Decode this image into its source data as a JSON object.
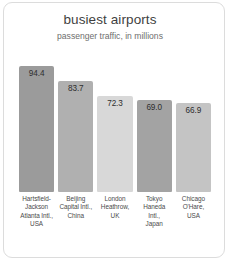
{
  "card": {
    "background": "#ffffff",
    "border_color": "#dcdcdc"
  },
  "chart_data": {
    "type": "bar",
    "title": "busiest airports",
    "subtitle": "passenger traffic, in millions",
    "xlabel": "",
    "ylabel": "",
    "ylim": [
      0,
      100
    ],
    "grid": false,
    "legend": "none",
    "value_label_position": "inside-top",
    "categories": [
      "Hartsfield-Jackson Atlanta Intl., USA",
      "Beijing Capital Intl., China",
      "London Heathrow, UK",
      "Tokyo Haneda Intl., Japan",
      "Chicago O'Hare, USA"
    ],
    "category_lines": [
      [
        "Hartsfield-",
        "Jackson",
        "Atlanta Intl.,",
        "USA"
      ],
      [
        "Beijing",
        "Capital Intl.,",
        "China"
      ],
      [
        "London",
        "Heathrow,",
        "UK"
      ],
      [
        "Tokyo",
        "Haneda",
        "Intl.,",
        "Japan"
      ],
      [
        "Chicago",
        "O'Hare,",
        "USA"
      ]
    ],
    "values": [
      94.4,
      83.7,
      72.3,
      69.0,
      66.9
    ],
    "value_labels": [
      "94.4",
      "83.7",
      "72.3",
      "69.0",
      "66.9"
    ],
    "bar_colors": [
      "#9b9b9b",
      "#b0b0b0",
      "#d8d8d8",
      "#a3a3a3",
      "#c4c4c4"
    ]
  }
}
